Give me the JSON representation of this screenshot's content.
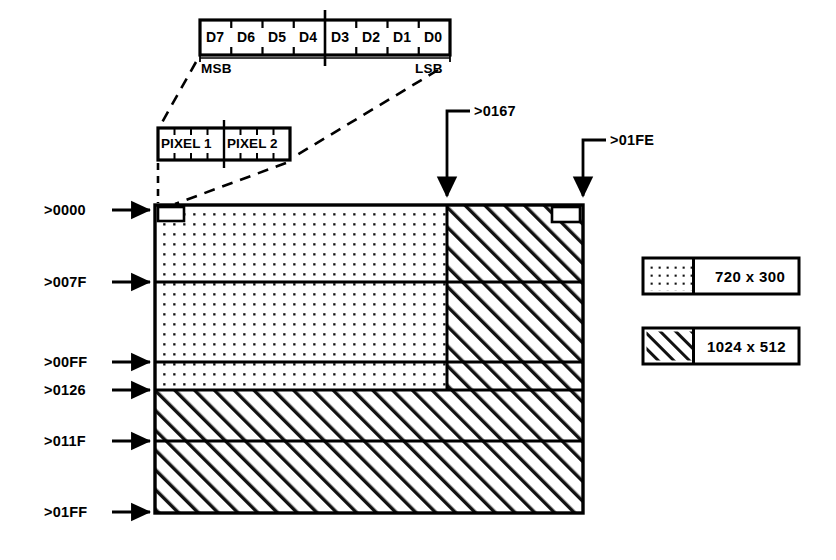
{
  "diagram": {
    "colors": {
      "ink": "#000000",
      "paper": "#ffffff"
    },
    "register": {
      "name": "byte-bit-register",
      "bits": [
        {
          "label": "D7"
        },
        {
          "label": "D6"
        },
        {
          "label": "D5"
        },
        {
          "label": "D4"
        },
        {
          "label": "D3"
        },
        {
          "label": "D2"
        },
        {
          "label": "D1"
        },
        {
          "label": "D0"
        }
      ],
      "msb_label": "MSB",
      "lsb_label": "LSB"
    },
    "pixel_box": {
      "name": "pixel-pair-box",
      "cells": [
        {
          "label": "PIXEL 1"
        },
        {
          "label": "PIXEL 2"
        }
      ]
    },
    "top_pointers": [
      {
        "label": ">0167"
      },
      {
        "label": ">01FE"
      }
    ],
    "left_pointers": [
      {
        "label": ">0000"
      },
      {
        "label": ">007F"
      },
      {
        "label": ">00FF"
      },
      {
        "label": ">0126"
      },
      {
        "label": ">011F"
      },
      {
        "label": ">01FF"
      }
    ],
    "legend": [
      {
        "pattern": "dots",
        "label": "720 x 300"
      },
      {
        "pattern": "hatch",
        "label": "1024 x 512"
      }
    ]
  }
}
